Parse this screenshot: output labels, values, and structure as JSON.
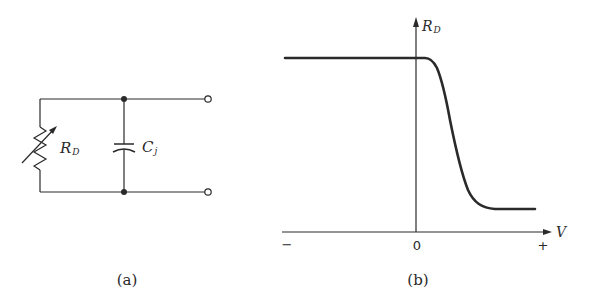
{
  "figure_a": {
    "caption": "(a)",
    "resistor_label": {
      "main": "R",
      "sub": "D"
    },
    "capacitor_label": {
      "main": "C",
      "sub": "j"
    },
    "components": [
      {
        "type": "variable-resistor",
        "label": "R_D"
      },
      {
        "type": "capacitor",
        "label": "C_j"
      }
    ],
    "terminals": 2,
    "junction_dots": 2
  },
  "figure_b": {
    "caption": "(b)",
    "y_axis_label": {
      "main": "R",
      "sub": "D"
    },
    "x_axis_label": "V",
    "tick_minus": "−",
    "tick_zero": "0",
    "tick_plus": "+"
  },
  "colors": {
    "ink": "#2a2a2a",
    "background": "#ffffff"
  }
}
